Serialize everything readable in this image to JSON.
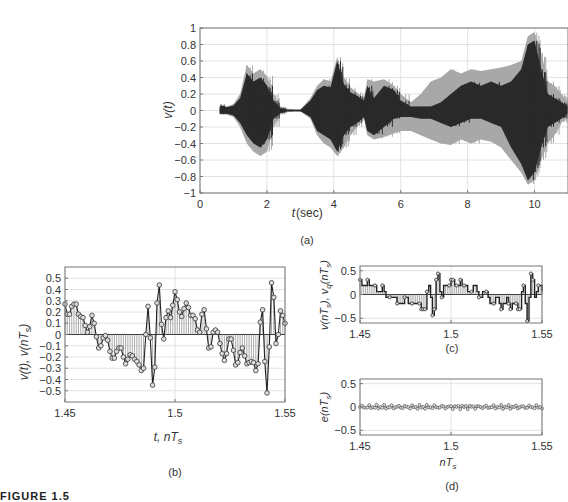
{
  "figure": {
    "caption_partial": "FIGURE 1.5"
  },
  "chart_data": [
    {
      "id": "a",
      "type": "area",
      "panel_label": "(a)",
      "title": "",
      "xlabel": "t(sec)",
      "ylabel": "v(t)",
      "xlim": [
        0,
        11
      ],
      "ylim": [
        -1,
        1
      ],
      "xticks": [
        0,
        2,
        4,
        6,
        8,
        10
      ],
      "xtick_labels": [
        "0",
        "2",
        "4",
        "6",
        "8",
        "10"
      ],
      "yticks": [
        -1,
        -0.8,
        -0.6,
        -0.4,
        -0.2,
        0,
        0.2,
        0.4,
        0.6,
        0.8,
        1
      ],
      "ytick_labels": [
        "−1",
        "−0.8",
        "−0.6",
        "−0.4",
        "−0.2",
        "0",
        "0.2",
        "0.4",
        "0.6",
        "0.8",
        "1"
      ],
      "grid": true,
      "series": [
        {
          "name": "envelope (light gray)",
          "color": "#a8a8a8",
          "x": [
            0.6,
            0.8,
            1.0,
            1.2,
            1.4,
            1.6,
            1.8,
            2.0,
            2.2,
            2.4,
            2.6,
            2.8,
            3.0,
            3.3,
            3.5,
            3.7,
            3.9,
            4.1,
            4.3,
            4.5,
            4.7,
            4.9,
            5.0,
            5.2,
            5.5,
            5.8,
            6.0,
            6.3,
            6.6,
            6.9,
            7.2,
            7.5,
            7.8,
            8.1,
            8.4,
            8.7,
            9.0,
            9.3,
            9.6,
            9.8,
            10.0,
            10.2,
            10.4,
            10.6,
            10.8,
            11.0
          ],
          "upper": [
            0.08,
            0.05,
            0.08,
            0.2,
            0.55,
            0.45,
            0.5,
            0.42,
            0.2,
            0.05,
            0.02,
            0.01,
            0.01,
            0.15,
            0.3,
            0.38,
            0.35,
            0.65,
            0.4,
            0.28,
            0.22,
            0.15,
            0.38,
            0.35,
            0.38,
            0.3,
            0.2,
            0.1,
            0.2,
            0.35,
            0.4,
            0.5,
            0.45,
            0.5,
            0.48,
            0.5,
            0.52,
            0.55,
            0.6,
            0.9,
            0.95,
            0.7,
            0.35,
            0.3,
            0.2,
            0.1
          ],
          "lower": [
            -0.05,
            -0.05,
            -0.08,
            -0.2,
            -0.4,
            -0.5,
            -0.55,
            -0.5,
            -0.2,
            -0.05,
            -0.02,
            -0.01,
            -0.01,
            -0.1,
            -0.3,
            -0.4,
            -0.45,
            -0.55,
            -0.45,
            -0.3,
            -0.2,
            -0.1,
            -0.3,
            -0.35,
            -0.32,
            -0.28,
            -0.25,
            -0.25,
            -0.3,
            -0.35,
            -0.4,
            -0.42,
            -0.35,
            -0.4,
            -0.35,
            -0.38,
            -0.45,
            -0.6,
            -0.75,
            -0.9,
            -0.85,
            -0.6,
            -0.4,
            -0.3,
            -0.15,
            -0.05
          ]
        },
        {
          "name": "signal (dark)",
          "color": "#2a2a2a",
          "x": [
            0.6,
            0.8,
            1.0,
            1.2,
            1.4,
            1.6,
            1.8,
            2.0,
            2.2,
            2.4,
            2.6,
            2.8,
            3.0,
            3.3,
            3.5,
            3.7,
            3.9,
            4.1,
            4.3,
            4.5,
            4.7,
            4.9,
            5.0,
            5.2,
            5.5,
            5.8,
            6.0,
            6.3,
            6.6,
            6.9,
            7.2,
            7.5,
            7.8,
            8.1,
            8.4,
            8.7,
            9.0,
            9.3,
            9.6,
            9.8,
            10.0,
            10.2,
            10.4,
            10.6,
            10.8,
            11.0
          ],
          "upper": [
            0.06,
            0.04,
            0.06,
            0.15,
            0.45,
            0.35,
            0.4,
            0.3,
            0.12,
            0.03,
            0.01,
            0.01,
            0.01,
            0.12,
            0.25,
            0.3,
            0.28,
            0.6,
            0.32,
            0.22,
            0.18,
            0.12,
            0.3,
            0.15,
            0.3,
            0.25,
            0.12,
            0.05,
            0.05,
            0.05,
            0.1,
            0.2,
            0.3,
            0.35,
            0.3,
            0.35,
            0.3,
            0.35,
            0.5,
            0.8,
            0.85,
            0.5,
            0.2,
            0.15,
            0.1,
            0.05
          ],
          "lower": [
            -0.04,
            -0.04,
            -0.06,
            -0.15,
            -0.3,
            -0.4,
            -0.45,
            -0.35,
            -0.1,
            -0.03,
            -0.01,
            -0.01,
            -0.01,
            -0.08,
            -0.25,
            -0.3,
            -0.35,
            -0.5,
            -0.3,
            -0.2,
            -0.15,
            -0.08,
            -0.25,
            -0.3,
            -0.2,
            -0.1,
            -0.08,
            -0.08,
            -0.1,
            -0.1,
            -0.15,
            -0.2,
            -0.15,
            -0.1,
            -0.1,
            -0.15,
            -0.2,
            -0.45,
            -0.65,
            -0.85,
            -0.75,
            -0.45,
            -0.2,
            -0.15,
            -0.1,
            -0.03
          ]
        }
      ]
    },
    {
      "id": "b",
      "type": "line",
      "subtype": "stem-with-markers",
      "panel_label": "(b)",
      "xlabel": "t, nT_s",
      "ylabel": "v(t), v(nT_s)",
      "xlim": [
        1.45,
        1.55
      ],
      "ylim": [
        -0.6,
        0.6
      ],
      "xticks": [
        1.45,
        1.5,
        1.55
      ],
      "xtick_labels": [
        "1.45",
        "1.5",
        "1.55"
      ],
      "yticks": [
        -0.5,
        -0.4,
        -0.3,
        -0.2,
        -0.1,
        0,
        0.1,
        0.2,
        0.3,
        0.4,
        0.5
      ],
      "ytick_labels": [
        "−0.5",
        "−0.4",
        "−0.3",
        "−0.2",
        "−0.1",
        "0",
        "0.1",
        "0.2",
        "0.3",
        "0.4",
        "0.5"
      ],
      "grid": true,
      "series": [
        {
          "name": "v(nT_s)",
          "values": [
            0.27,
            0.18,
            0.18,
            0.25,
            0.27,
            0.27,
            0.18,
            0.16,
            0.15,
            0.08,
            0.02,
            0.07,
            0.17,
            0.1,
            -0.02,
            -0.12,
            -0.1,
            -0.03,
            -0.01,
            -0.05,
            -0.15,
            -0.21,
            -0.21,
            -0.15,
            -0.12,
            -0.12,
            -0.2,
            -0.26,
            -0.22,
            -0.18,
            -0.19,
            -0.22,
            -0.24,
            -0.27,
            -0.32,
            -0.3,
            0.0,
            0.25,
            -0.03,
            -0.45,
            -0.29,
            0.28,
            0.44,
            0.09,
            -0.04,
            0.15,
            0.21,
            0.15,
            0.26,
            0.38,
            0.31,
            0.2,
            0.16,
            0.23,
            0.28,
            0.24,
            0.17,
            0.17,
            0.14,
            0.04,
            0.02,
            0.18,
            0.22,
            0.05,
            -0.12,
            -0.11,
            0.02,
            0.04,
            0.02,
            -0.08,
            -0.17,
            -0.23,
            -0.17,
            -0.04,
            -0.04,
            -0.14,
            -0.27,
            -0.25,
            -0.16,
            -0.12,
            -0.19,
            -0.26,
            -0.25,
            -0.24,
            -0.25,
            -0.32,
            -0.26,
            0.11,
            0.22,
            -0.24,
            -0.52,
            -0.11,
            0.46,
            0.33,
            -0.08,
            0.0,
            0.21,
            0.17,
            0.1
          ]
        }
      ]
    },
    {
      "id": "c",
      "type": "line",
      "subtype": "stem-with-markers",
      "panel_label": "(c)",
      "xlabel": "",
      "ylabel": "v(nT_s), v_q(nT_s)",
      "xlim": [
        1.45,
        1.55
      ],
      "ylim": [
        -0.6,
        0.6
      ],
      "xticks": [
        1.45,
        1.5,
        1.55
      ],
      "xtick_labels": [
        "1.45",
        "1.5",
        "1.55"
      ],
      "yticks": [
        -0.5,
        0,
        0.5
      ],
      "ytick_labels": [
        "−0.5",
        "0",
        "0.5"
      ],
      "grid": true,
      "series": [
        {
          "name": "v_q(nT_s) quantized",
          "values": [
            0.31,
            0.19,
            0.19,
            0.19,
            0.31,
            0.19,
            0.19,
            0.19,
            0.19,
            0.06,
            0.06,
            0.06,
            0.19,
            0.06,
            -0.06,
            -0.06,
            -0.06,
            -0.06,
            -0.06,
            -0.06,
            -0.19,
            -0.19,
            -0.19,
            -0.19,
            -0.06,
            -0.06,
            -0.19,
            -0.19,
            -0.19,
            -0.19,
            -0.19,
            -0.19,
            -0.19,
            -0.31,
            -0.31,
            -0.31,
            0.06,
            0.19,
            -0.06,
            -0.44,
            -0.31,
            0.31,
            0.44,
            0.06,
            -0.06,
            0.19,
            0.19,
            0.19,
            0.19,
            0.31,
            0.31,
            0.19,
            0.19,
            0.19,
            0.31,
            0.19,
            0.19,
            0.19,
            0.06,
            0.06,
            0.06,
            0.19,
            0.19,
            0.06,
            -0.06,
            -0.06,
            0.06,
            0.06,
            0.06,
            -0.06,
            -0.19,
            -0.19,
            -0.19,
            -0.06,
            -0.06,
            -0.19,
            -0.31,
            -0.19,
            -0.19,
            -0.06,
            -0.19,
            -0.31,
            -0.19,
            -0.19,
            -0.19,
            -0.31,
            -0.31,
            0.06,
            0.19,
            -0.19,
            -0.56,
            -0.06,
            0.44,
            0.31,
            -0.06,
            0.06,
            0.19,
            0.19,
            0.06
          ]
        }
      ]
    },
    {
      "id": "d",
      "type": "line",
      "subtype": "markers",
      "panel_label": "(d)",
      "xlabel": "nT_s",
      "ylabel": "e(nT_s)",
      "xlim": [
        1.45,
        1.55
      ],
      "ylim": [
        -0.6,
        0.6
      ],
      "xticks": [
        1.45,
        1.5,
        1.55
      ],
      "xtick_labels": [
        "1.45",
        "1.5",
        "1.55"
      ],
      "yticks": [
        -0.5,
        0,
        0.5
      ],
      "ytick_labels": [
        "−0.5",
        "0",
        "0.5"
      ],
      "grid": true,
      "series": [
        {
          "name": "e(nT_s) quantization error",
          "note": "small noise within ±0.06 around zero"
        }
      ]
    }
  ],
  "labels": {
    "a": {
      "ylabel": "v(t)",
      "xlabel_t": "t",
      "xlabel_unit": "(sec)",
      "panel": "(a)"
    },
    "b": {
      "ylabel_1": "v(t), v(nT",
      "ylabel_sub": "s",
      "ylabel_close": ")",
      "xlabel": "t, nT",
      "xlabel_sub": "s",
      "panel": "(b)"
    },
    "c": {
      "ylabel": "v(nT",
      "panel": "(c)"
    },
    "d": {
      "ylabel": "e(nT",
      "xlabel": "nT",
      "xlabel_sub": "s",
      "panel": "(d)"
    }
  }
}
